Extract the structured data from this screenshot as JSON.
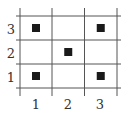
{
  "diagram": {
    "type": "grid",
    "columns": 3,
    "rows": 3,
    "x_labels": [
      "1",
      "2",
      "3"
    ],
    "y_labels": [
      "1",
      "2",
      "3"
    ],
    "filled_cells": [
      {
        "x": 1,
        "y": 3
      },
      {
        "x": 3,
        "y": 3
      },
      {
        "x": 2,
        "y": 2
      },
      {
        "x": 1,
        "y": 1
      },
      {
        "x": 3,
        "y": 1
      }
    ],
    "colors": {
      "grid_line": "#555555",
      "marker": "#1a1a1a",
      "label": "#333333",
      "background": "#ffffff"
    }
  }
}
